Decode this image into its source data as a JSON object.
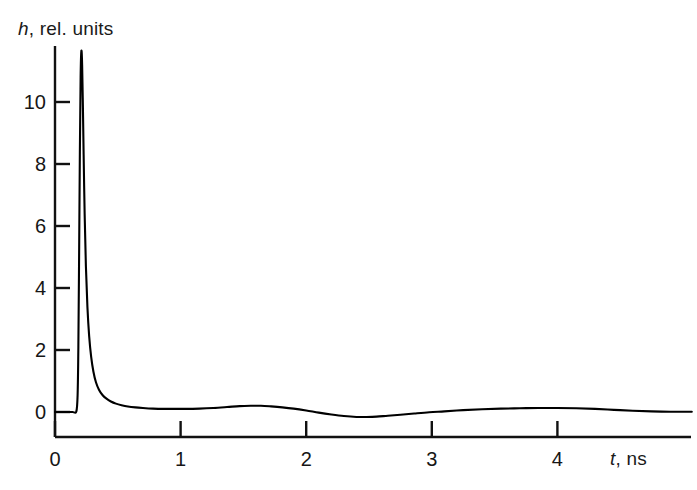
{
  "chart_data": {
    "type": "line",
    "title": "",
    "xlabel": "t, ns",
    "xlabel_symbol": "t",
    "xlabel_unit": ", ns",
    "ylabel": "h, rel. units",
    "ylabel_symbol": "h",
    "ylabel_unit": ", rel. units",
    "xlim": [
      0,
      5.07
    ],
    "ylim": [
      -0.8,
      12.3
    ],
    "xticks": [
      0,
      1,
      2,
      3,
      4
    ],
    "xticklabels": [
      "0",
      "1",
      "2",
      "3",
      "4"
    ],
    "yticks": [
      0,
      2,
      4,
      6,
      8,
      10
    ],
    "yticklabels": [
      "0",
      "2",
      "4",
      "6",
      "8",
      "10"
    ],
    "grid": false,
    "legend": null,
    "line_color": "#000000",
    "line_width": 2.1,
    "series": [
      {
        "name": "h(t)",
        "x": [
          0.0,
          0.05,
          0.1,
          0.14,
          0.17,
          0.18,
          0.186,
          0.192,
          0.198,
          0.204,
          0.21,
          0.216,
          0.222,
          0.228,
          0.236,
          0.246,
          0.258,
          0.272,
          0.288,
          0.306,
          0.326,
          0.35,
          0.378,
          0.41,
          0.445,
          0.485,
          0.53,
          0.58,
          0.64,
          0.7,
          0.78,
          0.86,
          0.95,
          1.05,
          1.15,
          1.26,
          1.37,
          1.47,
          1.56,
          1.64,
          1.72,
          1.81,
          1.9,
          2.0,
          2.1,
          2.2,
          2.3,
          2.4,
          2.48,
          2.56,
          2.65,
          2.75,
          2.86,
          2.98,
          3.1,
          3.25,
          3.4,
          3.55,
          3.7,
          3.85,
          4.0,
          4.15,
          4.3,
          4.45,
          4.6,
          4.75,
          4.9,
          5.07
        ],
        "y": [
          0.0,
          0.0,
          0.0,
          0.0,
          0.02,
          0.55,
          2.1,
          5.1,
          8.4,
          10.8,
          11.65,
          11.2,
          9.9,
          8.3,
          6.4,
          4.7,
          3.4,
          2.45,
          1.78,
          1.3,
          0.96,
          0.72,
          0.55,
          0.43,
          0.34,
          0.27,
          0.22,
          0.18,
          0.15,
          0.13,
          0.11,
          0.1,
          0.1,
          0.1,
          0.11,
          0.13,
          0.16,
          0.19,
          0.2,
          0.2,
          0.18,
          0.15,
          0.11,
          0.05,
          -0.02,
          -0.08,
          -0.13,
          -0.16,
          -0.16,
          -0.15,
          -0.12,
          -0.09,
          -0.05,
          -0.01,
          0.02,
          0.06,
          0.09,
          0.11,
          0.12,
          0.13,
          0.13,
          0.12,
          0.1,
          0.07,
          0.04,
          0.02,
          0.01,
          0.01
        ]
      }
    ]
  },
  "axes": {
    "y_axis_name": "vertical-axis",
    "x_axis_name": "horizontal-axis"
  }
}
